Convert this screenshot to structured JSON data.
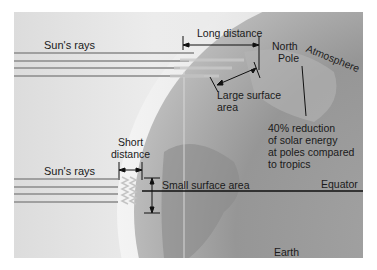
{
  "diagram": {
    "colors": {
      "background": "#e6e6e6",
      "earth_dark": "#8e8e8e",
      "earth_light": "#b8b8b8",
      "atmosphere": "#d4d4d4",
      "rays": "#9a9a9a",
      "lines": "#111111"
    },
    "labels": {
      "sun_rays_top": "Sun's rays",
      "sun_rays_bottom": "Sun's rays",
      "long_distance": "Long distance",
      "north_pole_line1": "North",
      "north_pole_line2": "Pole",
      "atmosphere": "Atmosphere",
      "large_surface_line1": "Large surface",
      "large_surface_line2": "area",
      "reduction_line1": "40% reduction",
      "reduction_line2": "of solar energy",
      "reduction_line3": "at poles compared",
      "reduction_line4": "to tropics",
      "short_distance_line1": "Short",
      "short_distance_line2": "distance",
      "small_surface": "Small surface area",
      "equator": "Equator",
      "earth": "Earth"
    },
    "icons": {
      "arrows": "double-headed-arrow",
      "rays": "horizontal-ray-lines"
    }
  }
}
